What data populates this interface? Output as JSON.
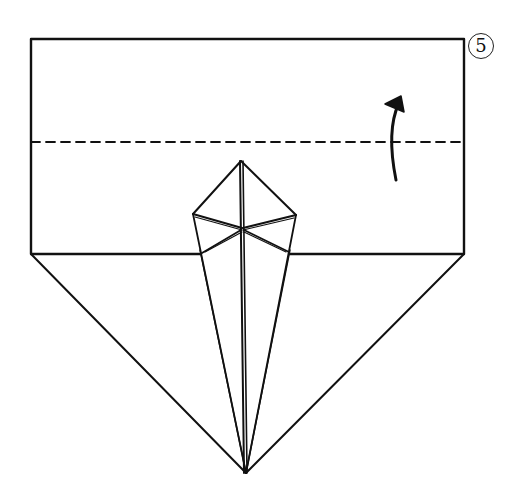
{
  "diagram": {
    "type": "origami-fold-step",
    "step_number": "5",
    "colors": {
      "line": "#111111",
      "background": "#ffffff"
    },
    "elements": {
      "upper_flap": "rectangle",
      "fold_line": "valley-fold-dashed",
      "fold_arrow": "curved-arrow-up",
      "lower_body": "triangle-point-down",
      "center_piece": "kite-with-star-crease"
    }
  }
}
